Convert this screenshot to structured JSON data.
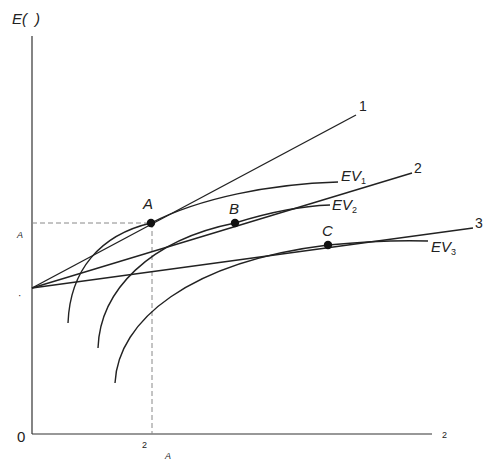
{
  "diagram": {
    "y_axis_label": "E(  )",
    "y_axis_label_main": "E(",
    "y_axis_label_close": ")",
    "origin_label": "0",
    "x_axis_end_label": "2",
    "x_tick_label": "2",
    "x_tick_sublabel": "A",
    "y_tick_label": "A",
    "intercept_marker": "·",
    "lines": [
      {
        "name": "line-1",
        "label": "1"
      },
      {
        "name": "line-2",
        "label": "2"
      },
      {
        "name": "line-3",
        "label": "3"
      }
    ],
    "curves": [
      {
        "name": "EV1",
        "main": "EV",
        "sub": "1"
      },
      {
        "name": "EV2",
        "main": "EV",
        "sub": "2"
      },
      {
        "name": "EV3",
        "main": "EV",
        "sub": "3"
      }
    ],
    "points": [
      {
        "label": "A"
      },
      {
        "label": "B"
      },
      {
        "label": "C"
      }
    ],
    "colors": {
      "line": "#222222",
      "axis": "#333333",
      "dashed": "#888888"
    }
  }
}
